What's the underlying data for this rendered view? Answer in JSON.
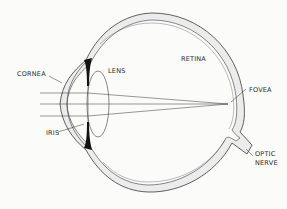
{
  "diagram": {
    "type": "anatomy-cross-section",
    "labels": {
      "cornea": "CORNEA",
      "lens": "LENS",
      "retina": "RETINA",
      "fovea": "FOVEA",
      "iris": "IRIS",
      "optic_nerve_line1": "OPTIC",
      "optic_nerve_line2": "NERVE"
    },
    "light_rays": 3,
    "colors": {
      "background": "#fbfbfa",
      "outline": "#3a3a3a",
      "sclera_fill": "#ececec",
      "iris_fill": "#111111"
    }
  }
}
